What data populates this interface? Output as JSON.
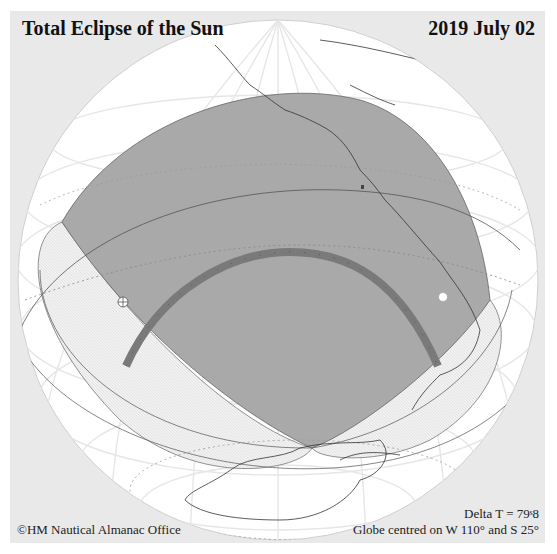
{
  "header": {
    "title": "Total Eclipse of the Sun",
    "date": "2019 July 02"
  },
  "footer": {
    "credit": "©HM Nautical Almanac Office",
    "delta_t": "Delta T = 79ˢ8",
    "globe_centre": "Globe centred on W 110° and S 25°"
  },
  "map": {
    "projection": "orthographic globe",
    "centre_longitude": "W 110°",
    "centre_latitude": "S 25°",
    "colors": {
      "panel_bg": "#e9e9e9",
      "globe": "#ffffff",
      "penumbra_region": "#a9a9a9",
      "central_path": "#7a7a7a",
      "hatched_region": "#eeeeee",
      "coastline": "#333333",
      "graticule": "#e4e4e4"
    },
    "features": [
      "penumbral shadow region (gray lens)",
      "path of totality (dark arc)",
      "sunrise/sunset hatched lobes",
      "greatest eclipse markers",
      "graticule and dotted tropic/circle lines",
      "coastlines of Americas and Antarctica"
    ]
  }
}
